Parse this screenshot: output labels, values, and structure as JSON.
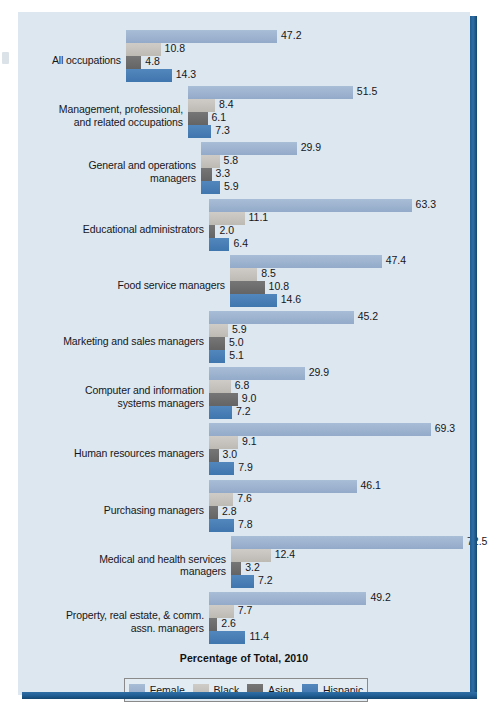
{
  "chart_data": {
    "type": "bar",
    "orientation": "horizontal",
    "title": "",
    "xlabel": "Percentage of Total, 2010",
    "ylabel": "",
    "xlim": [
      0,
      72.5
    ],
    "grid": false,
    "legend_position": "bottom",
    "series": [
      {
        "name": "Female",
        "color": "#9bb4d0",
        "values": [
          47.2,
          51.5,
          29.9,
          63.3,
          47.4,
          45.2,
          29.9,
          69.3,
          46.1,
          72.5,
          49.2
        ]
      },
      {
        "name": "Black",
        "color": "#c8c6c2",
        "values": [
          10.8,
          8.4,
          5.8,
          11.1,
          8.5,
          5.9,
          6.8,
          9.1,
          7.6,
          12.4,
          7.7
        ]
      },
      {
        "name": "Asian",
        "color": "#6e6e6e",
        "values": [
          4.8,
          6.1,
          3.3,
          2.0,
          10.8,
          5.0,
          9.0,
          3.0,
          2.8,
          3.2,
          2.6
        ]
      },
      {
        "name": "Hispanic",
        "color": "#4a7fb5",
        "values": [
          14.3,
          7.3,
          5.9,
          6.4,
          14.6,
          5.1,
          7.2,
          7.9,
          7.8,
          7.2,
          11.4
        ]
      }
    ],
    "categories": [
      "All occupations",
      "Management, professional,\nand related occupations",
      "General and operations\nmanagers",
      "Educational administrators",
      "Food service managers",
      "Marketing and sales managers",
      "Computer and information\nsystems managers",
      "Human resources managers",
      "Purchasing managers",
      "Medical and health services\nmanagers",
      "Property, real estate, & comm.\nassn. managers"
    ]
  },
  "legend": {
    "items": [
      {
        "label": "Female",
        "color": "#9bb4d0"
      },
      {
        "label": "Black",
        "color": "#c8c6c2"
      },
      {
        "label": "Asian",
        "color": "#6e6e6e"
      },
      {
        "label": "Hispanic",
        "color": "#4a7fb5"
      }
    ]
  },
  "axis_title": "Percentage of Total, 2010",
  "groups": [
    {
      "label": "All occupations",
      "values": [
        47.2,
        10.8,
        4.8,
        14.3
      ],
      "value_labels": [
        "47.2",
        "10.8",
        "4.8",
        "14.3"
      ]
    },
    {
      "label": "Management, professional,\nand related occupations",
      "values": [
        51.5,
        8.4,
        6.1,
        7.3
      ],
      "value_labels": [
        "51.5",
        "8.4",
        "6.1",
        "7.3"
      ]
    },
    {
      "label": "General and operations\nmanagers",
      "values": [
        29.9,
        5.8,
        3.3,
        5.9
      ],
      "value_labels": [
        "29.9",
        "5.8",
        "3.3",
        "5.9"
      ]
    },
    {
      "label": "Educational administrators",
      "values": [
        63.3,
        11.1,
        2.0,
        6.4
      ],
      "value_labels": [
        "63.3",
        "11.1",
        "2.0",
        "6.4"
      ]
    },
    {
      "label": "Food service managers",
      "values": [
        47.4,
        8.5,
        10.8,
        14.6
      ],
      "value_labels": [
        "47.4",
        "8.5",
        "10.8",
        "14.6"
      ]
    },
    {
      "label": "Marketing and sales managers",
      "values": [
        45.2,
        5.9,
        5.0,
        5.1
      ],
      "value_labels": [
        "45.2",
        "5.9",
        "5.0",
        "5.1"
      ]
    },
    {
      "label": "Computer and information\nsystems managers",
      "values": [
        29.9,
        6.8,
        9.0,
        7.2
      ],
      "value_labels": [
        "29.9",
        "6.8",
        "9.0",
        "7.2"
      ]
    },
    {
      "label": "Human resources managers",
      "values": [
        69.3,
        9.1,
        3.0,
        7.9
      ],
      "value_labels": [
        "69.3",
        "9.1",
        "3.0",
        "7.9"
      ]
    },
    {
      "label": "Purchasing managers",
      "values": [
        46.1,
        7.6,
        2.8,
        7.8
      ],
      "value_labels": [
        "46.1",
        "7.6",
        "2.8",
        "7.8"
      ]
    },
    {
      "label": "Medical and health services\nmanagers",
      "values": [
        72.5,
        12.4,
        3.2,
        7.2
      ],
      "value_labels": [
        "72.5",
        "12.4",
        "3.2",
        "7.2"
      ]
    },
    {
      "label": "Property, real estate, & comm.\nassn. managers",
      "values": [
        49.2,
        7.7,
        2.6,
        11.4
      ],
      "value_labels": [
        "49.2",
        "7.7",
        "2.6",
        "11.4"
      ]
    }
  ]
}
